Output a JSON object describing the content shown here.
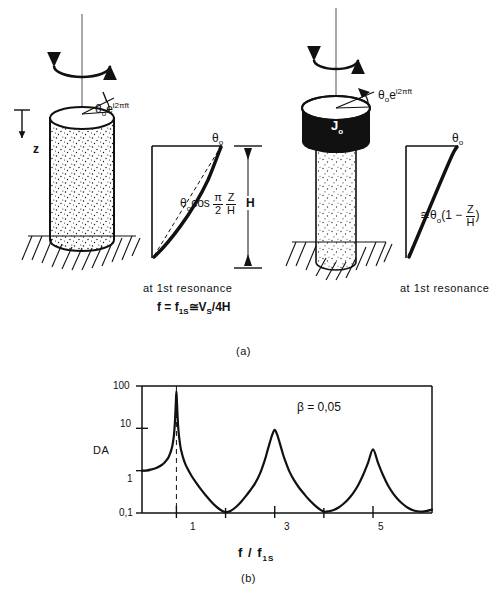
{
  "figure": {
    "panel_a_label": "(a)",
    "panel_b_label": "(b)"
  },
  "panel_a": {
    "left": {
      "excitation_label_theta": "θ",
      "excitation_label_sub": "o",
      "excitation_label_exp": "i2πft",
      "excitation_label_e": "e",
      "depth_axis_label": "z",
      "amplitude_label": "θ",
      "amplitude_label_sub": "o",
      "mode_shape_formula_prefix": "θ",
      "mode_shape_formula_sub": "o",
      "mode_shape_formula_cos": "cos",
      "mode_shape_num1": "π",
      "mode_shape_den1": "2",
      "mode_shape_num2": "Z",
      "mode_shape_den2": "H",
      "resonance_note": "at  1st  resonance",
      "resonance_formula_f": "f",
      "resonance_formula_eq": "=",
      "resonance_formula_f1s": "f",
      "resonance_formula_f1s_sub": "1S",
      "resonance_formula_approx": "≅",
      "resonance_formula_vs": "V",
      "resonance_formula_vs_sub": "S",
      "resonance_formula_tail": "/4H",
      "height_label": "H"
    },
    "right": {
      "excitation_label_theta": "θ",
      "excitation_label_sub": "o",
      "excitation_label_e": "e",
      "excitation_label_exp": "i2πft",
      "mass_label": "J",
      "mass_label_sub": "o",
      "amplitude_label": "θ",
      "amplitude_label_sub": "o",
      "mode_shape_approx": "≅",
      "mode_shape_theta": "θ",
      "mode_shape_sub": "o",
      "mode_shape_paren_open": "(1 −",
      "mode_shape_num": "Z",
      "mode_shape_den": "H",
      "mode_shape_paren_close": ")",
      "resonance_note": "at  1st  resonance"
    }
  },
  "chart_data": {
    "type": "line",
    "title": "",
    "xlabel": "f / f1S",
    "ylabel": "DA",
    "annotation": "β = 0,05",
    "annotation_symbol": "β",
    "annotation_value": "0,05",
    "yscale": "log",
    "ylim": [
      0.1,
      100
    ],
    "ytick_labels": [
      "100",
      "10",
      "1",
      "0,1"
    ],
    "ytick_values": [
      100,
      10,
      1,
      0.1
    ],
    "xlim": [
      0.3,
      6.2
    ],
    "xtick_labels": [
      "1",
      "3",
      "5"
    ],
    "xtick_values": [
      1,
      3,
      5
    ],
    "minor_xticks": [
      2,
      4
    ],
    "grid": false,
    "legend": false,
    "dashed_marker_x": 1,
    "peaks": [
      {
        "x": 1,
        "y": 75
      },
      {
        "x": 3,
        "y": 9.2
      },
      {
        "x": 5,
        "y": 3.2
      }
    ],
    "troughs": [
      {
        "x": 2,
        "y": 0.105
      },
      {
        "x": 4,
        "y": 0.108
      }
    ],
    "baseline_start": {
      "x": 0.3,
      "y": 1.0
    },
    "series": [
      {
        "name": "DA",
        "x": [
          0.3,
          0.4,
          0.5,
          0.55,
          0.6,
          0.65,
          0.7,
          0.75,
          0.8,
          0.84,
          0.88,
          0.9,
          0.92,
          0.94,
          0.95,
          0.96,
          0.97,
          0.98,
          0.99,
          1.0,
          1.01,
          1.02,
          1.03,
          1.04,
          1.05,
          1.06,
          1.08,
          1.1,
          1.14,
          1.18,
          1.22,
          1.3,
          1.4,
          1.5,
          1.6,
          1.7,
          1.8,
          1.9,
          2.0,
          2.1,
          2.2,
          2.3,
          2.4,
          2.5,
          2.6,
          2.7,
          2.8,
          2.85,
          2.9,
          2.95,
          3.0,
          3.05,
          3.1,
          3.15,
          3.2,
          3.3,
          3.4,
          3.5,
          3.6,
          3.7,
          3.8,
          3.9,
          4.0,
          4.1,
          4.2,
          4.3,
          4.4,
          4.5,
          4.6,
          4.7,
          4.8,
          4.9,
          5.0,
          5.1,
          5.2,
          5.3,
          5.4,
          5.5,
          5.6,
          5.7,
          5.8,
          5.9,
          6.0,
          6.1,
          6.2
        ],
        "y": [
          1.0,
          1.02,
          1.07,
          1.11,
          1.17,
          1.25,
          1.36,
          1.52,
          1.78,
          2.08,
          2.7,
          3.2,
          4.0,
          5.6,
          7.0,
          9.5,
          14.0,
          24.0,
          45.0,
          75.0,
          45.0,
          24.0,
          14.0,
          9.5,
          7.0,
          5.6,
          3.8,
          2.9,
          1.95,
          1.45,
          1.15,
          0.78,
          0.52,
          0.36,
          0.26,
          0.19,
          0.145,
          0.118,
          0.105,
          0.112,
          0.135,
          0.175,
          0.24,
          0.34,
          0.5,
          0.85,
          1.8,
          2.9,
          4.6,
          7.1,
          9.2,
          7.1,
          4.6,
          2.9,
          1.9,
          0.95,
          0.58,
          0.39,
          0.28,
          0.205,
          0.158,
          0.126,
          0.108,
          0.11,
          0.118,
          0.135,
          0.165,
          0.215,
          0.3,
          0.46,
          0.8,
          1.55,
          3.2,
          1.55,
          0.8,
          0.46,
          0.3,
          0.215,
          0.165,
          0.135,
          0.118,
          0.11,
          0.108,
          0.112,
          0.12
        ]
      }
    ]
  }
}
